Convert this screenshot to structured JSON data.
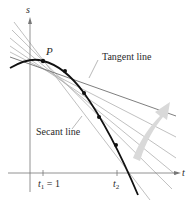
{
  "figure": {
    "axes": {
      "y_label": "s",
      "x_label": "t"
    },
    "point_label": "P",
    "annotations": {
      "tangent": "Tangent line",
      "secant": "Secant line"
    },
    "ticks": {
      "t1_var": "t",
      "t1_sub": "1",
      "t1_value": " = 1",
      "t2_var": "t",
      "t2_sub": "2"
    },
    "colors": {
      "curve": "#111111",
      "secant_lines": "#a8a8a8",
      "tangent_line": "#6a6a6a",
      "axes": "#777777",
      "arrow": "#d6d6d6"
    }
  }
}
